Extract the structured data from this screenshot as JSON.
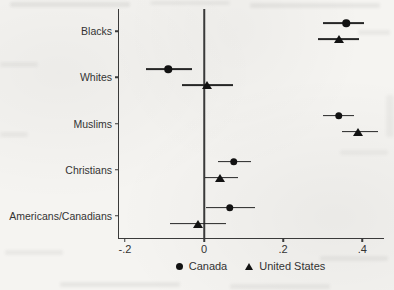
{
  "page": {
    "background_color": "#f5f4f1",
    "ink_color": "#121212"
  },
  "chart_data": {
    "type": "scatter",
    "subtype": "coefficient_dot_whisker_plot",
    "categories": [
      "Blacks",
      "Whites",
      "Muslims",
      "Christians",
      "Americans/Canadians"
    ],
    "series": [
      {
        "name": "Canada",
        "marker": "circle",
        "values": [
          0.36,
          -0.09,
          0.34,
          0.075,
          0.065
        ],
        "ci_low": [
          0.3,
          -0.147,
          0.3,
          0.035,
          0.005
        ],
        "ci_high": [
          0.405,
          -0.03,
          0.38,
          0.12,
          0.13
        ]
      },
      {
        "name": "United States",
        "marker": "triangle",
        "values": [
          0.34,
          0.008,
          0.39,
          0.04,
          -0.015
        ],
        "ci_low": [
          0.288,
          -0.055,
          0.35,
          0.003,
          -0.085
        ],
        "ci_high": [
          0.392,
          0.073,
          0.44,
          0.086,
          0.055
        ]
      }
    ],
    "x_ticks": {
      "values": [
        -0.2,
        0,
        0.2,
        0.4
      ],
      "labels": [
        "-.2",
        "0",
        ".2",
        ".4"
      ]
    },
    "xlim": [
      -0.215,
      0.455
    ],
    "zero_line": 0,
    "grid": false,
    "legend_position": "bottom-center",
    "colors": {
      "marker": "#121212",
      "axis": "#3a3a3a",
      "whisker": "#262626",
      "text": "#333333"
    }
  }
}
